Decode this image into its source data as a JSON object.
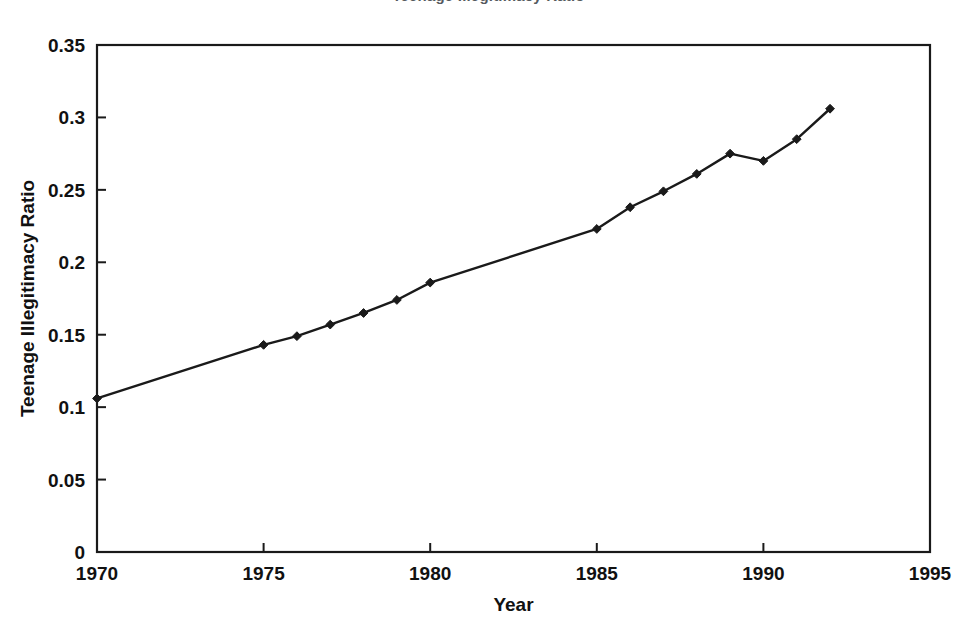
{
  "figure": {
    "title_partial": "Teenage Illegitimacy Ratio",
    "background_color": "#ffffff",
    "ink_color": "#1a1a1a"
  },
  "chart_data": {
    "type": "line",
    "title": "Teenage Illegitimacy Ratio",
    "xlabel": "Year",
    "ylabel": "Teenage Illegitimacy Ratio",
    "xlim": [
      1970,
      1995
    ],
    "ylim": [
      0,
      0.35
    ],
    "grid": false,
    "legend": "none",
    "marker": "diamond",
    "line_color": "#1a1a1a",
    "marker_color": "#1a1a1a",
    "x_ticks": [
      "1970",
      "1975",
      "1980",
      "1985",
      "1990",
      "1995"
    ],
    "x_tick_values": [
      1970,
      1975,
      1980,
      1985,
      1990,
      1995
    ],
    "y_ticks": [
      "0",
      "0.05",
      "0.1",
      "0.15",
      "0.2",
      "0.25",
      "0.3",
      "0.35"
    ],
    "y_tick_values": [
      0,
      0.05,
      0.1,
      0.15,
      0.2,
      0.25,
      0.3,
      0.35
    ],
    "x": [
      1970,
      1975,
      1976,
      1977,
      1978,
      1979,
      1980,
      1985,
      1986,
      1987,
      1988,
      1989,
      1990,
      1991,
      1992
    ],
    "values": [
      0.106,
      0.143,
      0.149,
      0.157,
      0.165,
      0.174,
      0.186,
      0.223,
      0.238,
      0.249,
      0.261,
      0.275,
      0.27,
      0.285,
      0.306
    ],
    "series": [
      {
        "name": "Teenage Illegitimacy Ratio",
        "x": [
          1970,
          1975,
          1976,
          1977,
          1978,
          1979,
          1980,
          1985,
          1986,
          1987,
          1988,
          1989,
          1990,
          1991,
          1992
        ],
        "values": [
          0.106,
          0.143,
          0.149,
          0.157,
          0.165,
          0.174,
          0.186,
          0.223,
          0.238,
          0.249,
          0.261,
          0.275,
          0.27,
          0.285,
          0.306
        ]
      }
    ]
  }
}
